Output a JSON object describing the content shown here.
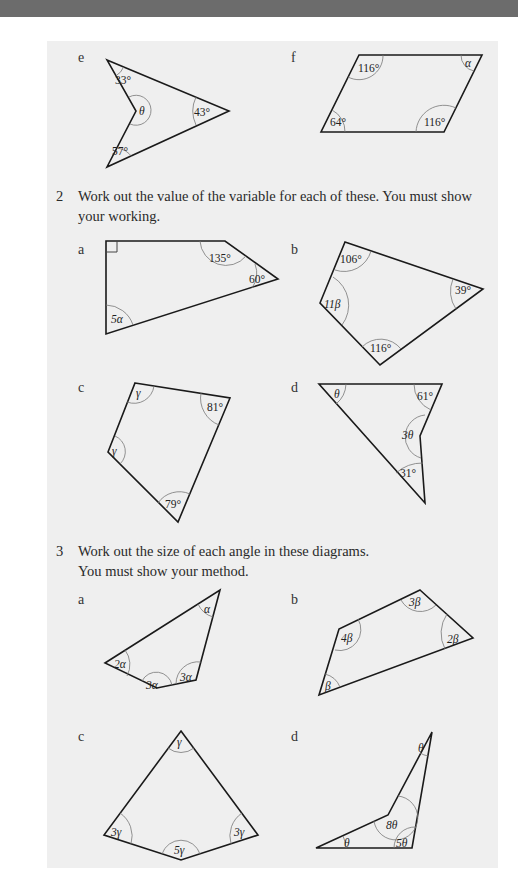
{
  "colors": {
    "top_band": "#6c6c6c",
    "panel_bg": "#efefef",
    "line": "#1a1a1a",
    "arc": "#777777"
  },
  "question1": {
    "parts": [
      {
        "label": "e",
        "angles": [
          "33°",
          "θ",
          "43°",
          "57°"
        ]
      },
      {
        "label": "f",
        "angles": [
          "116°",
          "α",
          "64°",
          "116°"
        ]
      }
    ]
  },
  "question2": {
    "number": "2",
    "text_line1": "Work out the value of the variable for each of these. You must show",
    "text_line2": "your working.",
    "parts": [
      {
        "label": "a",
        "angles": [
          "135°",
          "60°",
          "5α"
        ],
        "right_angle": true
      },
      {
        "label": "b",
        "angles": [
          "106°",
          "39°",
          "11β",
          "116°"
        ]
      },
      {
        "label": "c",
        "angles": [
          "γ",
          "81°",
          "γ",
          "79°"
        ]
      },
      {
        "label": "d",
        "angles": [
          "θ",
          "61°",
          "3θ",
          "31°"
        ]
      }
    ]
  },
  "question3": {
    "number": "3",
    "text_line1": "Work out the size of each angle in these diagrams.",
    "text_line2": "You must show your method.",
    "parts": [
      {
        "label": "a",
        "angles": [
          "α",
          "2α",
          "3α",
          "3α"
        ]
      },
      {
        "label": "b",
        "angles": [
          "3β",
          "4β",
          "2β",
          "β"
        ]
      },
      {
        "label": "c",
        "angles": [
          "γ",
          "3γ",
          "3γ",
          "5γ"
        ]
      },
      {
        "label": "d",
        "angles": [
          "θ",
          "8θ",
          "θ",
          "5θ"
        ]
      }
    ]
  }
}
